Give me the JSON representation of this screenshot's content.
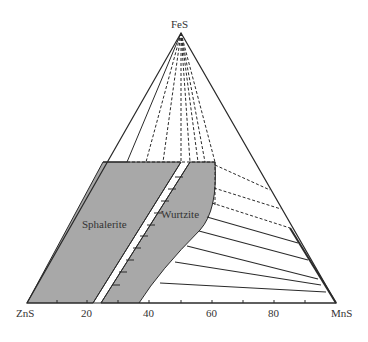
{
  "diagram": {
    "type": "ternary-phase-diagram",
    "vertices": {
      "top": "FeS",
      "left": "ZnS",
      "right": "MnS"
    },
    "axis_ticks": [
      {
        "label": "20",
        "x": 87
      },
      {
        "label": "40",
        "x": 149
      },
      {
        "label": "60",
        "x": 212
      },
      {
        "label": "80",
        "x": 274
      }
    ],
    "regions": [
      {
        "name": "Sphalerite",
        "label": "Sphalerite"
      },
      {
        "name": "Wurtzite",
        "label": "Wurtzite"
      }
    ],
    "colors": {
      "fill": "#a8a8a8",
      "line": "#2a2a2a",
      "text": "#333333"
    }
  }
}
